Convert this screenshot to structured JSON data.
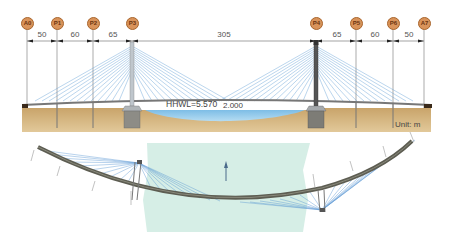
{
  "elevation": {
    "piers": [
      {
        "id": "A0",
        "x": 27
      },
      {
        "id": "P1",
        "x": 57
      },
      {
        "id": "P2",
        "x": 93
      },
      {
        "id": "P3",
        "x": 132
      },
      {
        "id": "P4",
        "x": 316
      },
      {
        "id": "P5",
        "x": 356
      },
      {
        "id": "P6",
        "x": 393
      },
      {
        "id": "A7",
        "x": 424
      }
    ],
    "spans": [
      {
        "label": "50",
        "x": 42
      },
      {
        "label": "60",
        "x": 75
      },
      {
        "label": "65",
        "x": 113
      },
      {
        "label": "305",
        "x": 224
      },
      {
        "label": "65",
        "x": 337
      },
      {
        "label": "60",
        "x": 375
      },
      {
        "label": "50",
        "x": 409
      }
    ],
    "water_level_label": "HHWL=5.570",
    "water_depth_label": "2.000",
    "unit_label": "Unit: m"
  },
  "colors": {
    "pier_badge": "#d9935a",
    "cable": "#4a8ed0",
    "ground": "#c9a46a",
    "water": "#8fc8ea",
    "deck": "#6b6b5e",
    "river_plan": "#d6eee6"
  }
}
